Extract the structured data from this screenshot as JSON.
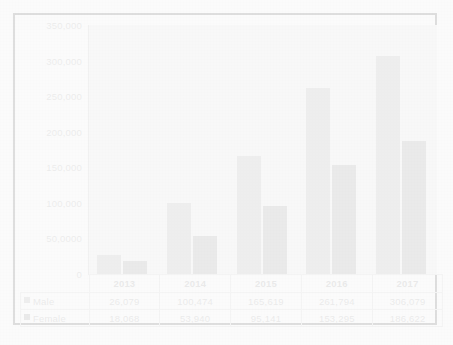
{
  "chart_data": {
    "type": "bar",
    "title": "",
    "xlabel": "",
    "ylabel": "",
    "categories": [
      "2013",
      "2014",
      "2015",
      "2016",
      "2017"
    ],
    "series": [
      {
        "name": "Male",
        "color": "#a9a9a9",
        "values": [
          26079,
          100474,
          165619,
          261794,
          306079
        ],
        "labels": [
          "26,079",
          "100,474",
          "165,619",
          "261,794",
          "306,079"
        ]
      },
      {
        "name": "Female",
        "color": "#8c8c8c",
        "values": [
          18068,
          53940,
          95141,
          153295,
          186622
        ],
        "labels": [
          "18,068",
          "53,940",
          "95,141",
          "153,295",
          "186,622"
        ]
      }
    ],
    "ylim": [
      0,
      350000
    ],
    "ytick_values": [
      0,
      50000,
      100000,
      150000,
      200000,
      250000,
      300000,
      350000
    ],
    "ytick_labels": [
      "0",
      "50,0000",
      "100,000",
      "150,000",
      "200,000",
      "250,000",
      "300,000",
      "350,000"
    ],
    "grid": false,
    "legend_position": "data-table-left",
    "data_table_visible": true
  },
  "colors": {
    "male_bar": "#a9a9a9",
    "female_bar": "#8c8c8c",
    "plot_background": "#ebebeb",
    "frame_border": "#3b3b3b",
    "tick_text": "#9b9b9b",
    "table_border": "#cfcfcf"
  }
}
